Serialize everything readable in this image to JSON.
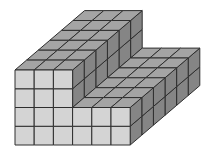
{
  "figure": {
    "description": "Oblique drawing of an L-shaped structure built from unit cubes",
    "width_cubes": 6,
    "depth_cubes": 6,
    "base_height_cubes": 2,
    "tall_section": {
      "width_cubes": 3,
      "height_cubes": 4
    },
    "total_cubes": 96
  },
  "projection": {
    "origin": [
      15,
      145
    ],
    "unit_x": [
      19.2,
      0
    ],
    "unit_y": [
      0,
      -18.75
    ],
    "unit_z": [
      11.6,
      -9.9
    ]
  },
  "colors": {
    "front": "#d4d4d4",
    "top": "#a4a4a4",
    "side": "#858585",
    "edge": "#2e2e2e",
    "background": "#ffffff"
  }
}
